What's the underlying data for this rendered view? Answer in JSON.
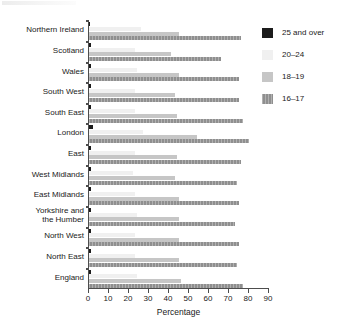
{
  "chart_data": {
    "type": "bar",
    "orientation": "horizontal",
    "title": "",
    "xlabel": "Percentage",
    "ylabel": "",
    "xlim": [
      0,
      90
    ],
    "xticks": [
      0,
      10,
      20,
      30,
      40,
      50,
      60,
      70,
      80,
      90
    ],
    "grid": false,
    "legend_position": "right",
    "categories": [
      "Northern Ireland",
      "Scotland",
      "Wales",
      "South West",
      "South East",
      "London",
      "East",
      "West Midlands",
      "East Midlands",
      "Yorkshire and\nthe Humber",
      "North West",
      "North East",
      "England"
    ],
    "series": [
      {
        "name": "25 and over",
        "color": "#1c1c1c",
        "values": [
          0.6,
          1.0,
          0.8,
          0.8,
          0.9,
          2.0,
          0.8,
          1.0,
          1.1,
          0.9,
          1.0,
          1.0,
          1.2
        ]
      },
      {
        "name": "20–24",
        "color": "#f0f0f0",
        "values": [
          26,
          23,
          24,
          23,
          23,
          27,
          23,
          22,
          23,
          24,
          23,
          23,
          24
        ]
      },
      {
        "name": "18–19",
        "color": "#c6c6c6",
        "values": [
          45,
          41,
          45,
          43,
          44,
          54,
          44,
          43,
          45,
          45,
          45,
          45,
          46
        ]
      },
      {
        "name": "16–17",
        "color": "#8f8f8f",
        "values": [
          76,
          66,
          75,
          75,
          77,
          80,
          76,
          74,
          75,
          73,
          75,
          74,
          77
        ]
      }
    ]
  },
  "legend": {
    "entries": [
      {
        "label": "25 and over",
        "color": "#1c1c1c"
      },
      {
        "label": "20–24",
        "color": "#f0f0f0"
      },
      {
        "label": "18–19",
        "color": "#c6c6c6"
      },
      {
        "label": "16–17",
        "color": "#8f8f8f"
      }
    ]
  },
  "axis": {
    "x_title": "Percentage"
  }
}
